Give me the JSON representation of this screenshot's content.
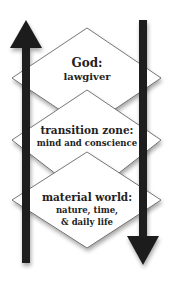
{
  "diagram": {
    "colors": {
      "background": "#ffffff",
      "diamond_fill": "#ffffff",
      "diamond_stroke": "#555555",
      "arrow": "#1e1e1e",
      "text": "#222222"
    },
    "arrows": [
      {
        "name": "up-arrow",
        "direction": "up"
      },
      {
        "name": "down-arrow",
        "direction": "down"
      }
    ],
    "levels": [
      {
        "title": "God:",
        "lines": [
          "lawgiver"
        ]
      },
      {
        "title": "transition zone:",
        "lines": [
          "mind and conscience"
        ]
      },
      {
        "title": "material world:",
        "lines": [
          "nature, time,",
          "& daily life"
        ]
      }
    ]
  }
}
